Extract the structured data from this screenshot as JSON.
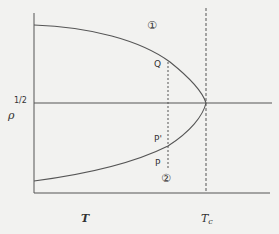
{
  "diagram": {
    "type": "phase-coexistence-curve",
    "y_axis_label": "ρ",
    "y_tick_label": "1/2",
    "x_axis_label": "T",
    "critical_label": "Tc",
    "critical_label_main": "T",
    "critical_label_sub": "c",
    "region_labels": [
      "②",
      "①"
    ],
    "points": [
      {
        "name": "Q",
        "label": "Q"
      },
      {
        "name": "P-prime",
        "label": "P'"
      },
      {
        "name": "P",
        "label": "P"
      }
    ],
    "colors": {
      "background": "#f2f2f0",
      "ink": "#444444"
    }
  }
}
